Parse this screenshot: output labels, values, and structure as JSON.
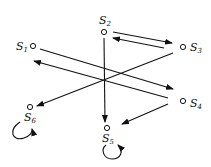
{
  "diagram": {
    "type": "state-transition-graph",
    "nodes": [
      {
        "id": "S1",
        "label": "S",
        "sub": "1",
        "x": 33,
        "y": 46
      },
      {
        "id": "S2",
        "label": "S",
        "sub": "2",
        "x": 104,
        "y": 32
      },
      {
        "id": "S3",
        "label": "S",
        "sub": "3",
        "x": 183,
        "y": 47
      },
      {
        "id": "S4",
        "label": "S",
        "sub": "4",
        "x": 183,
        "y": 101
      },
      {
        "id": "S5",
        "label": "S",
        "sub": "5",
        "x": 107,
        "y": 128
      },
      {
        "id": "S6",
        "label": "S",
        "sub": "6",
        "x": 30,
        "y": 107
      }
    ],
    "edges": [
      {
        "from": "S2",
        "to": "S3"
      },
      {
        "from": "S3",
        "to": "S2"
      },
      {
        "from": "S1",
        "to": "S4"
      },
      {
        "from": "S4",
        "to": "S1"
      },
      {
        "from": "S3",
        "to": "S6"
      },
      {
        "from": "S2",
        "to": "S5"
      },
      {
        "from": "S4",
        "to": "S5"
      },
      {
        "from": "S6",
        "to": "S6"
      },
      {
        "from": "S5",
        "to": "S5"
      }
    ]
  },
  "labels": {
    "s1": "S",
    "s1_sub": "1",
    "s2": "S",
    "s2_sub": "2",
    "s3": "S",
    "s3_sub": "3",
    "s4": "S",
    "s4_sub": "4",
    "s5": "S",
    "s5_sub": "5",
    "s6": "S",
    "s6_sub": "6"
  }
}
